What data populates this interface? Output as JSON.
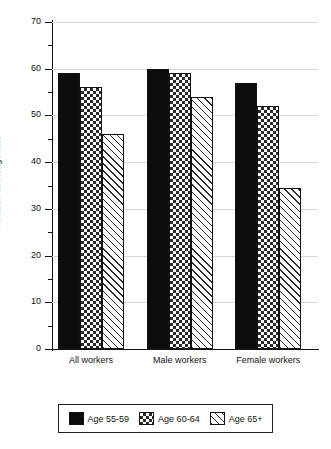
{
  "chart_data": {
    "type": "bar",
    "title": "",
    "xlabel": "",
    "ylabel": "Pension coverage rate",
    "ylim": [
      0,
      70
    ],
    "ytick_step": 10,
    "yminor_step": 5,
    "grid": true,
    "legend_position": "bottom",
    "categories": [
      "All workers",
      "Male workers",
      "Female workers"
    ],
    "yticks": [
      "0",
      "10",
      "20",
      "30",
      "40",
      "50",
      "60",
      "70"
    ],
    "series": [
      {
        "name": "Age 55-59",
        "pattern": "solid",
        "color": "#0d0d0d",
        "values": [
          59,
          60,
          57
        ]
      },
      {
        "name": "Age 60-64",
        "pattern": "crosshatch",
        "color": "#2a2a2a",
        "values": [
          56,
          59,
          52
        ]
      },
      {
        "name": "Age 65+",
        "pattern": "diagonal",
        "color": "#2a2a2a",
        "values": [
          46,
          54,
          34.5
        ]
      }
    ]
  },
  "legend": {
    "items": [
      {
        "label": "Age 55-59"
      },
      {
        "label": "Age 60-64"
      },
      {
        "label": "Age 65+"
      }
    ]
  }
}
